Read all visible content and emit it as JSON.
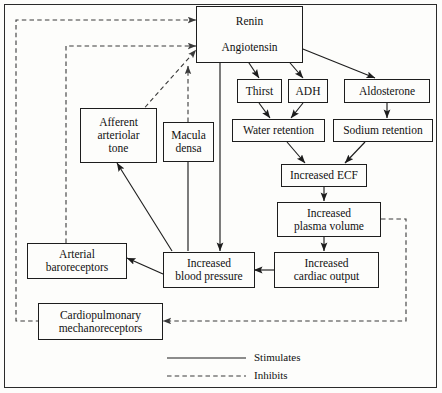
{
  "diagram": {
    "nodes": [
      {
        "id": "renin",
        "label": "Renin"
      },
      {
        "id": "angiotensin",
        "label": "Angiotensin"
      },
      {
        "id": "thirst",
        "label": "Thirst"
      },
      {
        "id": "adh",
        "label": "ADH"
      },
      {
        "id": "aldosterone",
        "label": "Aldosterone"
      },
      {
        "id": "water_retention",
        "label": "Water retention"
      },
      {
        "id": "sodium_retention",
        "label": "Sodium retention"
      },
      {
        "id": "increased_ecf",
        "label": "Increased ECF"
      },
      {
        "id": "increased_plasma_volume",
        "label": "Increased\nplasma volume",
        "line1": "Increased",
        "line2": "plasma volume"
      },
      {
        "id": "increased_cardiac_output",
        "label": "Increased\ncardiac output",
        "line1": "Increased",
        "line2": "cardiac output"
      },
      {
        "id": "increased_blood_pressure",
        "label": "Increased\nblood pressure",
        "line1": "Increased",
        "line2": "blood pressure"
      },
      {
        "id": "afferent_arteriolar_tone",
        "label": "Afferent\narteriolar\ntone",
        "line1": "Afferent",
        "line2": "arteriolar",
        "line3": "tone"
      },
      {
        "id": "macula_densa",
        "label": "Macula\ndensa",
        "line1": "Macula",
        "line2": "densa"
      },
      {
        "id": "arterial_baroreceptors",
        "label": "Arterial\nbaroreceptors",
        "line1": "Arterial",
        "line2": "baroreceptors"
      },
      {
        "id": "cardiopulmonary_mechanoreceptors",
        "label": "Cardiopulmonary\nmechanoreceptors",
        "line1": "Cardiopulmonary",
        "line2": "mechanoreceptors"
      }
    ],
    "legend": {
      "stimulates": "Stimulates",
      "inhibits": "Inhibits"
    },
    "edges": [
      {
        "from": "renin",
        "to": "angiotensin",
        "type": "stimulates"
      },
      {
        "from": "angiotensin",
        "to": "thirst",
        "type": "stimulates"
      },
      {
        "from": "angiotensin",
        "to": "adh",
        "type": "stimulates"
      },
      {
        "from": "angiotensin",
        "to": "aldosterone",
        "type": "stimulates"
      },
      {
        "from": "thirst",
        "to": "water_retention",
        "type": "stimulates"
      },
      {
        "from": "adh",
        "to": "water_retention",
        "type": "stimulates"
      },
      {
        "from": "aldosterone",
        "to": "sodium_retention",
        "type": "stimulates"
      },
      {
        "from": "water_retention",
        "to": "increased_ecf",
        "type": "stimulates"
      },
      {
        "from": "sodium_retention",
        "to": "increased_ecf",
        "type": "stimulates"
      },
      {
        "from": "increased_ecf",
        "to": "increased_plasma_volume",
        "type": "stimulates"
      },
      {
        "from": "increased_plasma_volume",
        "to": "increased_cardiac_output",
        "type": "stimulates"
      },
      {
        "from": "increased_cardiac_output",
        "to": "increased_blood_pressure",
        "type": "stimulates"
      },
      {
        "from": "angiotensin",
        "to": "increased_blood_pressure",
        "type": "stimulates"
      },
      {
        "from": "increased_blood_pressure",
        "to": "afferent_arteriolar_tone",
        "type": "stimulates"
      },
      {
        "from": "increased_blood_pressure",
        "to": "macula_densa",
        "type": "stimulates"
      },
      {
        "from": "increased_blood_pressure",
        "to": "arterial_baroreceptors",
        "type": "stimulates"
      },
      {
        "from": "afferent_arteriolar_tone",
        "to": "renin",
        "type": "inhibits"
      },
      {
        "from": "macula_densa",
        "to": "renin",
        "type": "inhibits"
      },
      {
        "from": "arterial_baroreceptors",
        "to": "renin",
        "type": "inhibits"
      },
      {
        "from": "cardiopulmonary_mechanoreceptors",
        "to": "renin",
        "type": "inhibits"
      },
      {
        "from": "increased_plasma_volume",
        "to": "cardiopulmonary_mechanoreceptors",
        "type": "inhibits"
      }
    ]
  }
}
